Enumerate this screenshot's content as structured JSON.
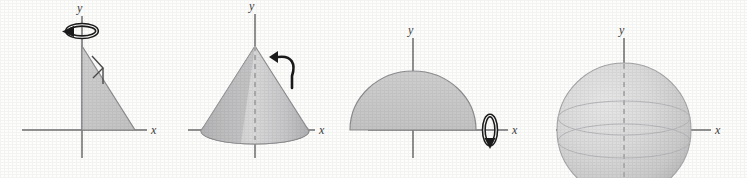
{
  "figure": {
    "background_color": "#fdfdfc",
    "axis_color": "#6e6e70",
    "outline_color": "#8d8d90",
    "region_fill": "#c9c9c9",
    "solid_fill_light": "#d8d8d8",
    "solid_fill_dark": "#b9b9bb",
    "arrow_color": "#1b1b1b",
    "dashed_color": "#b0b0b2"
  },
  "panels": [
    {
      "id": "panel-triangle",
      "name": "plane-region-triangle",
      "caption": "",
      "description": "Right triangle region in the first quadrant with a rotation arrow about the y-axis",
      "axes": {
        "x_label": "x",
        "y_label": "y"
      },
      "revolution_axis": "y",
      "arrow_icon": "rotation-arrow-horizontal-ellipse",
      "has_right_angle_marker": true,
      "shape": "triangle"
    },
    {
      "id": "panel-cone",
      "name": "solid-of-revolution-cone",
      "caption": "",
      "description": "Cone generated by revolving the triangle about the y-axis",
      "axes": {
        "x_label": "x",
        "y_label": "y"
      },
      "revolution_axis": "y",
      "arrow_icon": "curved-hook-arrow",
      "has_dashed_axis": true,
      "shape": "cone"
    },
    {
      "id": "panel-semicircle",
      "name": "plane-region-semicircle",
      "caption": "",
      "description": "Half-disk region above the x-axis with a rotation arrow about the x-axis",
      "axes": {
        "x_label": "x",
        "y_label": "y"
      },
      "revolution_axis": "x",
      "arrow_icon": "rotation-arrow-vertical-ellipse",
      "has_right_angle_marker": false,
      "shape": "semicircle"
    },
    {
      "id": "panel-sphere",
      "name": "solid-of-revolution-sphere",
      "caption": "",
      "description": "Sphere generated by revolving the half-disk about the x-axis",
      "axes": {
        "x_label": "x",
        "y_label": "y"
      },
      "revolution_axis": "x",
      "arrow_icon": "",
      "has_dashed_axis": true,
      "shape": "sphere"
    }
  ]
}
